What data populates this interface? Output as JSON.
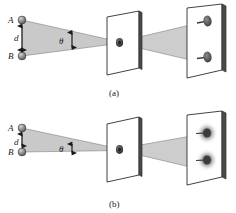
{
  "figure": {
    "background_color": "#ffffff",
    "ink_color": "#1a1a1a",
    "cone_fill": "#c9c9c9",
    "screen_fill": "#ffffff",
    "screen_edge_color": "#3a3a3a",
    "spot_color": "#4a4a4a"
  },
  "panels": [
    {
      "id": "a",
      "caption": "(a)",
      "source_top_label": "A",
      "source_bottom_label": "B",
      "separation_label": "d",
      "angle_label": "θ",
      "state": "resolved",
      "spot_style": "sharp",
      "angle_deg": 12,
      "separation_px": 36,
      "spot_count": 2
    },
    {
      "id": "b",
      "caption": "(b)",
      "source_top_label": "A",
      "source_bottom_label": "B",
      "separation_label": "d",
      "angle_label": "θ",
      "state": "unresolved",
      "spot_style": "blurred",
      "angle_deg": 6,
      "separation_px": 24,
      "spot_count": 2
    }
  ],
  "elements": {
    "source_sphere": "sphere-icon",
    "separation_arrow": "double-arrow-vertical-icon",
    "angle_arrow": "double-arrow-vertical-icon",
    "aperture": "pinhole-icon",
    "middle_screen": "aperture-screen",
    "far_screen": "detection-screen"
  }
}
